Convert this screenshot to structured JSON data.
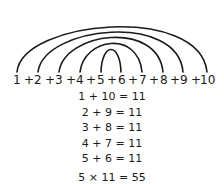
{
  "numbers": [
    "1",
    "2",
    "3",
    "4",
    "5",
    "6",
    "7",
    "8",
    "9",
    "10"
  ],
  "plus": "+",
  "pairs": [
    {
      "a": 1,
      "b": 10,
      "text": "1 + 10 = 11"
    },
    {
      "a": 2,
      "b": 9,
      "text": "2 + 9 = 11"
    },
    {
      "a": 3,
      "b": 8,
      "text": "3 + 8 = 11"
    },
    {
      "a": 4,
      "b": 7,
      "text": "4 + 7 = 11"
    },
    {
      "a": 5,
      "b": 6,
      "text": "5 + 6 = 11"
    }
  ],
  "result": "5 × 11 = 55",
  "colors": {
    "stroke": "#1a1a1a",
    "background": "#ffffff"
  }
}
